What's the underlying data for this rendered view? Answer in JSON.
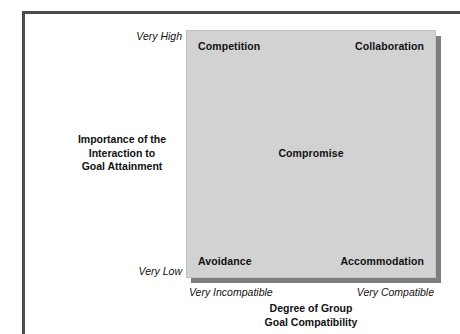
{
  "figure": {
    "matrix": {
      "cells": [
        {
          "id": "competition",
          "label": "Competition"
        },
        {
          "id": "collaboration",
          "label": "Collaboration"
        },
        {
          "id": "compromise",
          "label": "Compromise"
        },
        {
          "id": "avoidance",
          "label": "Avoidance"
        },
        {
          "id": "accommodation",
          "label": "Accommodation"
        }
      ],
      "fill_color": "#d2d2d2",
      "shadow_color": "#7d7d7d"
    },
    "y_axis": {
      "title_line1": "Importance of the",
      "title_line2": "Interaction to",
      "title_line3": "Goal Attainment",
      "high_label": "Very High",
      "low_label": "Very Low"
    },
    "x_axis": {
      "title_line1": "Degree of Group",
      "title_line2": "Goal Compatibility",
      "low_label": "Very Incompatible",
      "high_label": "Very Compatible"
    },
    "frame_color": "#4b4b4b",
    "text_color": "#111111"
  },
  "chart_data": {
    "type": "scatter",
    "title": "",
    "xlabel": "Degree of Group Goal Compatibility",
    "ylabel": "Importance of the Interaction to Goal Attainment",
    "x_tick_labels": [
      "Very Incompatible",
      "Very Compatible"
    ],
    "y_tick_labels": [
      "Very Low",
      "Very High"
    ],
    "xlim": [
      0,
      1
    ],
    "ylim": [
      0,
      1
    ],
    "grid": false,
    "legend": "none",
    "annotations": [
      {
        "text": "Competition",
        "x": 0.05,
        "y": 0.95
      },
      {
        "text": "Collaboration",
        "x": 0.95,
        "y": 0.95
      },
      {
        "text": "Compromise",
        "x": 0.5,
        "y": 0.5
      },
      {
        "text": "Avoidance",
        "x": 0.05,
        "y": 0.05
      },
      {
        "text": "Accommodation",
        "x": 0.95,
        "y": 0.05
      }
    ]
  }
}
